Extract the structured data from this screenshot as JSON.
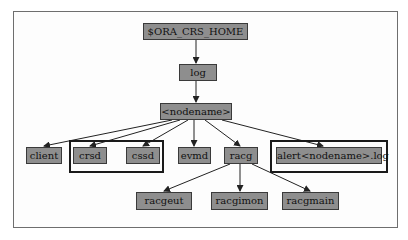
{
  "diagram": {
    "type": "directory-tree",
    "root": "$ORA_CRS_HOME",
    "nodes": {
      "root": "$ORA_CRS_HOME",
      "log": "log",
      "nodename": "<nodename>",
      "client": "client",
      "crsd": "crsd",
      "cssd": "cssd",
      "evmd": "evmd",
      "racg": "racg",
      "alert": "alert<nodename>.log",
      "racgeut": "racgeut",
      "racgimon": "racgimon",
      "racgmain": "racgmain"
    },
    "edges": [
      [
        "$ORA_CRS_HOME",
        "log"
      ],
      [
        "log",
        "<nodename>"
      ],
      [
        "<nodename>",
        "client"
      ],
      [
        "<nodename>",
        "crsd"
      ],
      [
        "<nodename>",
        "cssd"
      ],
      [
        "<nodename>",
        "evmd"
      ],
      [
        "<nodename>",
        "racg"
      ],
      [
        "<nodename>",
        "alert<nodename>.log"
      ],
      [
        "racg",
        "racgeut"
      ],
      [
        "racg",
        "racgimon"
      ],
      [
        "racg",
        "racgmain"
      ]
    ],
    "highlighted_groups": [
      [
        "crsd",
        "cssd"
      ],
      [
        "alert<nodename>.log"
      ]
    ],
    "colors": {
      "node_fill": "#8e8e8e",
      "node_border": "#3a3a3a",
      "group_border": "#1a1a1a",
      "edge": "#222222"
    }
  }
}
